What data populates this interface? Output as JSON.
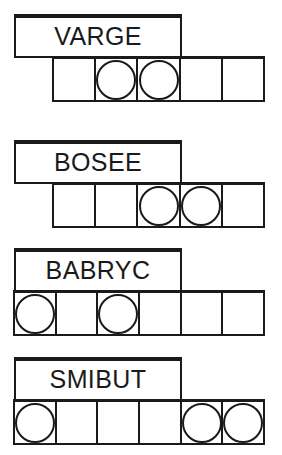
{
  "diagram": {
    "ink_color": "#1a1a1a",
    "background_color": "#ffffff",
    "groups": [
      {
        "id": "group-varge",
        "word": "VARGE",
        "label_box": {
          "x": 14,
          "y": 14,
          "width": 168,
          "height": 44
        },
        "row": {
          "x": 52,
          "y": 56,
          "width": 213,
          "height": 46,
          "cells": 5
        },
        "cells": [
          {
            "index": 1,
            "circle": false
          },
          {
            "index": 2,
            "circle": true
          },
          {
            "index": 3,
            "circle": true
          },
          {
            "index": 4,
            "circle": false
          },
          {
            "index": 5,
            "circle": false
          }
        ]
      },
      {
        "id": "group-bosee",
        "word": "BOSEE",
        "label_box": {
          "x": 14,
          "y": 140,
          "width": 168,
          "height": 44
        },
        "row": {
          "x": 52,
          "y": 182,
          "width": 213,
          "height": 46,
          "cells": 5
        },
        "cells": [
          {
            "index": 1,
            "circle": false
          },
          {
            "index": 2,
            "circle": false
          },
          {
            "index": 3,
            "circle": true
          },
          {
            "index": 4,
            "circle": true
          },
          {
            "index": 5,
            "circle": false
          }
        ]
      },
      {
        "id": "group-babryc",
        "word": "BABRYC",
        "label_box": {
          "x": 14,
          "y": 248,
          "width": 168,
          "height": 44
        },
        "row": {
          "x": 13,
          "y": 290,
          "width": 252,
          "height": 46,
          "cells": 6
        },
        "cells": [
          {
            "index": 1,
            "circle": true
          },
          {
            "index": 2,
            "circle": false
          },
          {
            "index": 3,
            "circle": true
          },
          {
            "index": 4,
            "circle": false
          },
          {
            "index": 5,
            "circle": false
          },
          {
            "index": 6,
            "circle": false
          }
        ]
      },
      {
        "id": "group-smibut",
        "word": "SMIBUT",
        "label_box": {
          "x": 14,
          "y": 357,
          "width": 168,
          "height": 44
        },
        "row": {
          "x": 13,
          "y": 399,
          "width": 252,
          "height": 46,
          "cells": 6
        },
        "cells": [
          {
            "index": 1,
            "circle": true
          },
          {
            "index": 2,
            "circle": false
          },
          {
            "index": 3,
            "circle": false
          },
          {
            "index": 4,
            "circle": false
          },
          {
            "index": 5,
            "circle": true
          },
          {
            "index": 6,
            "circle": true
          }
        ]
      }
    ]
  }
}
